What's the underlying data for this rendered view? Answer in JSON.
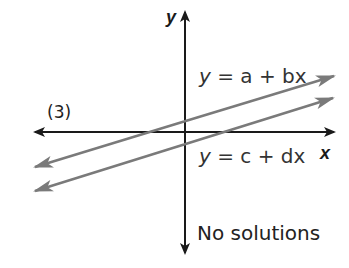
{
  "figure": {
    "panel_label": "(3)",
    "axes": {
      "x_label": "x",
      "y_label": "y"
    },
    "lines": [
      {
        "name": "line-a-bx",
        "label": "y = a + bx",
        "parts": [
          "y",
          " = ",
          "a",
          " + ",
          "b",
          "x"
        ],
        "color": "#7a7a7a"
      },
      {
        "name": "line-c-dx",
        "label": "y = c + dx",
        "parts": [
          "y",
          " = ",
          "c",
          " + ",
          "d",
          "x"
        ],
        "color": "#7a7a7a"
      }
    ],
    "caption": "No solutions",
    "colors": {
      "axis": "#1a1a1a",
      "line": "#7a7a7a",
      "background": "#ffffff"
    }
  }
}
